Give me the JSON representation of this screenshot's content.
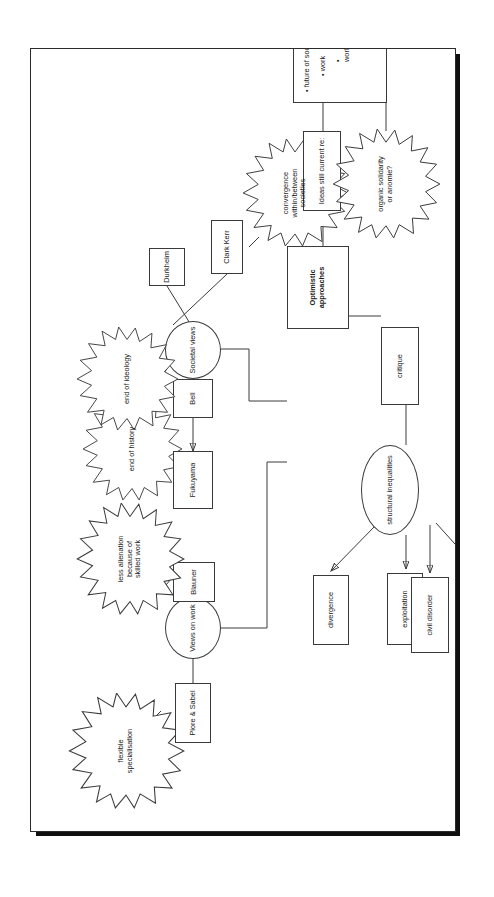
{
  "document": {
    "type": "concept-map",
    "orientation": "rotated-90-ccw",
    "title": "Optimistic approaches concept map"
  },
  "nodes": {
    "flexible_specialisation": "flexible\nspecialisation",
    "flexible_specialisation_l1": "flexible",
    "flexible_specialisation_l2": "specialisation",
    "piore_sabel": "Piore & Sabel",
    "views_on_work": "Views on work",
    "blauner": "Blauner",
    "less_alienation_l1": "less alienation",
    "less_alienation_l2": "because of",
    "less_alienation_l3": "skilled work",
    "end_of_history": "end of history",
    "fukuyama": "Fukuyama",
    "end_of_ideology": "end of ideology",
    "bell": "Bell",
    "societal_views": "Societal views",
    "optimistic_l1": "Optimistic",
    "optimistic_l2": "approaches",
    "clark_kerr": "Clark Kerr",
    "durkheim": "Durkheim",
    "convergence_l1": "convergence",
    "convergence_l2": "within/between",
    "convergence_l3": "societies",
    "organic_l1": "organic solidarity",
    "organic_l2": "or anomie?",
    "ideas_still_current": "Ideas still current re:",
    "future_b1": "• future of society",
    "future_b2": "• work",
    "future_b3": "• workforce",
    "critique": "critique",
    "structural_inequalities": "structural inequalities",
    "exploitation": "exploitation",
    "divergence": "divergence",
    "civil_disorder": "civil disorder",
    "work_intensification": "work intensification"
  },
  "colors": {
    "stroke": "#3a3a3a",
    "text": "#1a1a1a",
    "page_border": "#2b2b2b",
    "page_shadow": "#101010",
    "background": "#ffffff"
  }
}
